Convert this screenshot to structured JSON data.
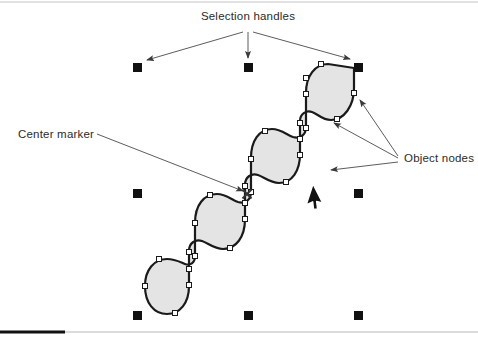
{
  "figure": {
    "kind": "vector-editor-illustration",
    "canvas": {
      "width": 478,
      "height": 339,
      "background": "#ffffff"
    }
  },
  "annotations": {
    "selection_handles": {
      "label": "Selection handles",
      "x": 248,
      "y": 20,
      "anchor": "middle"
    },
    "center_marker": {
      "label": "Center marker",
      "x": 18,
      "y": 138,
      "anchor": "start"
    },
    "object_nodes": {
      "label": "Object nodes",
      "x": 404,
      "y": 162,
      "anchor": "start"
    }
  },
  "colors": {
    "shape_fill": "#e4e4e4",
    "shape_stroke": "#1a1a1a",
    "handle_fill": "#111111",
    "node_fill": "#ffffff",
    "node_stroke": "#1a1a1a",
    "leader_line": "#4a4a4a",
    "text": "#2b2b2b",
    "rule_dark": "#111111",
    "rule_light": "#b9b9b9",
    "cursor_fill": "#111111",
    "cursor_stroke": "#ffffff"
  },
  "selection_handles": {
    "name": "selection-handle",
    "size": 9,
    "count": 8,
    "positions": [
      {
        "id": "top-left",
        "x": 133,
        "y": 63
      },
      {
        "id": "top-center",
        "x": 244,
        "y": 63
      },
      {
        "id": "top-right",
        "x": 354,
        "y": 63
      },
      {
        "id": "middle-left",
        "x": 133,
        "y": 189
      },
      {
        "id": "middle-right",
        "x": 354,
        "y": 189
      },
      {
        "id": "bottom-left",
        "x": 133,
        "y": 311
      },
      {
        "id": "bottom-center",
        "x": 244,
        "y": 311
      },
      {
        "id": "bottom-right",
        "x": 354,
        "y": 311
      }
    ]
  },
  "center_marker": {
    "name": "center-marker-x",
    "x": 247,
    "y": 194,
    "glyph": "x",
    "size": 9
  },
  "mouse_cursor": {
    "name": "mouse-pointer",
    "x": 313,
    "y": 184,
    "rotation_deg": 18
  },
  "shape": {
    "name": "selected-vector-shape",
    "path": "M 354 68 L 354 68 C 354 68 354 85 354 88 C 354 106 344 120 331 120 C 322 120 318 114 312 112 C 306 110 300 114 300 121 C 300 128 300 147 300 154 C 300 171 292 183 279 183 C 270 183 264 177 258 175 C 251 173 245 177 245 185 C 245 193 245 212 245 219 C 245 237 236 249 223 249 C 214 249 208 243 202 241 C 195 239 189 243 189 251 C 189 259 189 278 189 286 C 189 303 180 314 167 314 C 154 314 145 303 145 286 C 145 270 154 259 167 259 C 175 259 180 262 185 264 C 190 266 195 263 195 256 C 195 249 195 230 195 223 C 195 205 204 194 217 194 C 226 194 232 200 238 202 C 245 204 251 200 251 192 C 251 185 251 166 251 158 C 251 141 259 129 272 129 C 281 129 287 135 293 137 C 300 139 306 135 306 127 C 306 120 306 101 306 93 C 306 76 315 64 328 64 Z",
    "stroke_width": 2.2
  },
  "object_nodes": {
    "name": "object-node",
    "size": 5,
    "positions": [
      {
        "x": 321,
        "y": 64
      },
      {
        "x": 354,
        "y": 93
      },
      {
        "x": 337,
        "y": 119
      },
      {
        "x": 300,
        "y": 123
      },
      {
        "x": 300,
        "y": 155
      },
      {
        "x": 286,
        "y": 182
      },
      {
        "x": 245,
        "y": 186
      },
      {
        "x": 245,
        "y": 219
      },
      {
        "x": 230,
        "y": 248
      },
      {
        "x": 189,
        "y": 252
      },
      {
        "x": 189,
        "y": 285
      },
      {
        "x": 175,
        "y": 313
      },
      {
        "x": 145,
        "y": 286
      },
      {
        "x": 159,
        "y": 259
      },
      {
        "x": 195,
        "y": 256
      },
      {
        "x": 195,
        "y": 223
      },
      {
        "x": 210,
        "y": 195
      },
      {
        "x": 251,
        "y": 192
      },
      {
        "x": 251,
        "y": 159
      },
      {
        "x": 265,
        "y": 131
      },
      {
        "x": 306,
        "y": 128
      },
      {
        "x": 306,
        "y": 94
      },
      {
        "x": 306,
        "y": 78
      },
      {
        "x": 189,
        "y": 269
      },
      {
        "x": 245,
        "y": 203
      },
      {
        "x": 300,
        "y": 139
      }
    ]
  },
  "leader_lines": {
    "selection_handles": [
      {
        "id": "to-top-left",
        "x1": 243,
        "y1": 32,
        "x2": 147,
        "y2": 60
      },
      {
        "id": "to-top-center",
        "x1": 248,
        "y1": 32,
        "x2": 248,
        "y2": 58
      },
      {
        "id": "to-top-right",
        "x1": 253,
        "y1": 32,
        "x2": 350,
        "y2": 59
      }
    ],
    "center_marker": [
      {
        "id": "to-center-x",
        "x1": 97,
        "y1": 134,
        "x2": 243,
        "y2": 191
      }
    ],
    "object_nodes": [
      {
        "id": "to-node-upper",
        "x1": 398,
        "y1": 156,
        "x2": 360,
        "y2": 100
      },
      {
        "id": "to-node-mid",
        "x1": 398,
        "y1": 158,
        "x2": 334,
        "y2": 123
      },
      {
        "id": "to-node-lower",
        "x1": 398,
        "y1": 162,
        "x2": 331,
        "y2": 170
      }
    ]
  },
  "rules": {
    "top_rule": {
      "x1": 0,
      "y1": 2,
      "x2": 478,
      "y2": 2,
      "color": "#c4c4c4",
      "width": 1
    },
    "bottom_rule_dark": {
      "x1": 0,
      "y1": 332,
      "x2": 65,
      "y2": 332,
      "color": "#111111",
      "width": 3
    },
    "bottom_rule_light": {
      "x1": 65,
      "y1": 332,
      "x2": 478,
      "y2": 332,
      "color": "#b9b9b9",
      "width": 1
    }
  }
}
